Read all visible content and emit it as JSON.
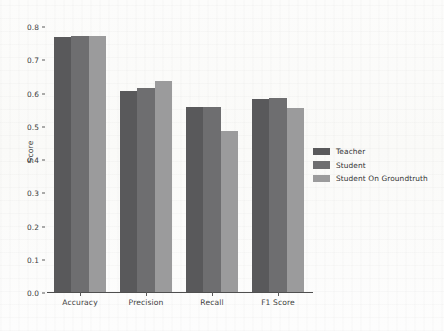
{
  "chart_data": {
    "type": "bar",
    "title": "",
    "xlabel": "",
    "ylabel": "Score",
    "ylim": [
      0.0,
      0.8
    ],
    "yticks": [
      "0.0",
      "0.1",
      "0.2",
      "0.3",
      "0.4",
      "0.5",
      "0.6",
      "0.7",
      "0.8"
    ],
    "ytick_values": [
      0.0,
      0.1,
      0.2,
      0.3,
      0.4,
      0.5,
      0.6,
      0.7,
      0.8
    ],
    "grid": false,
    "legend_position": "right",
    "categories": [
      "Accuracy",
      "Precision",
      "Recall",
      "F1 Score"
    ],
    "series": [
      {
        "name": "Teacher",
        "color": "#59595b",
        "values": [
          0.769,
          0.607,
          0.56,
          0.583
        ]
      },
      {
        "name": "Student",
        "color": "#6e6e70",
        "values": [
          0.772,
          0.617,
          0.56,
          0.587
        ]
      },
      {
        "name": "Student On Groundtruth",
        "color": "#9b9b9c",
        "values": [
          0.773,
          0.637,
          0.488,
          0.555
        ]
      }
    ]
  },
  "axis": {
    "baseline_color": "#4f4f4f",
    "tick_color": "#5a5a5a",
    "text_color": "#3e3e3e"
  }
}
